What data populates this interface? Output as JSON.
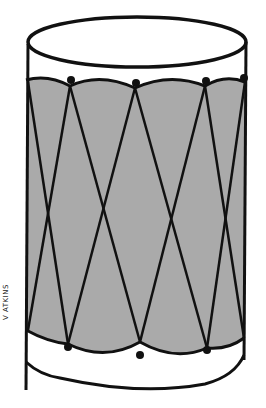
{
  "illustration": {
    "subject": "Drum with laced cords",
    "signature": "V ATKINS",
    "colors": {
      "outline": "#111111",
      "body_fill": "#aaaaaa",
      "background": "#ffffff",
      "rim_fill": "#ffffff"
    }
  }
}
